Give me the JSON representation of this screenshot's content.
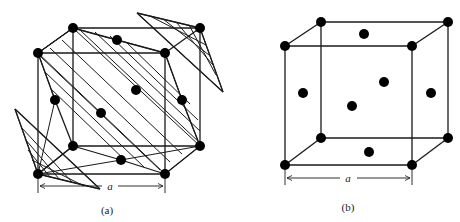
{
  "figure": {
    "panels": [
      {
        "id": "a",
        "caption": "(a)",
        "dimension_label": "a",
        "description": "FCC unit cell with shaded (111)-type close-packed planes"
      },
      {
        "id": "b",
        "caption": "(b)",
        "dimension_label": "a",
        "description": "FCC unit cell showing corner and face-centered atoms"
      }
    ],
    "colors": {
      "line": "#1a1a1a",
      "atom": "#000000",
      "background": "#ffffff"
    }
  }
}
